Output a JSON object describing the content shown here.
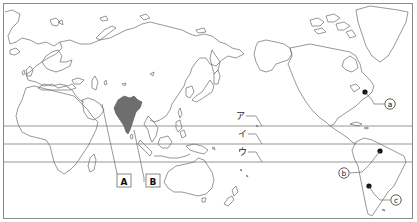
{
  "map": {
    "projection": "pacific-centered world map",
    "highlighted_country": "India",
    "shade_color": "#6e6e6e",
    "line_color": "#6b6b6b",
    "latitude_lines": [
      {
        "label": "ア",
        "y": 126
      },
      {
        "label": "イ",
        "y": 144
      },
      {
        "label": "ウ",
        "y": 162
      }
    ],
    "box_labels": [
      {
        "label": "A",
        "target": "Arabian Peninsula / west coast of India area"
      },
      {
        "label": "B",
        "target": "India"
      }
    ],
    "point_labels": [
      {
        "label": "ⓐ",
        "text": "a",
        "location": "eastern North America"
      },
      {
        "label": "ⓑ",
        "text": "b",
        "location": "central Brazil"
      },
      {
        "label": "ⓒ",
        "text": "c",
        "location": "northern Argentina"
      }
    ]
  }
}
